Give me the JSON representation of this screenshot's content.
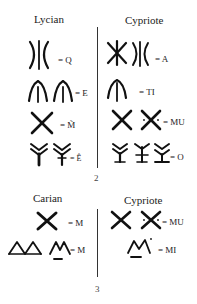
{
  "figure_2": {
    "number": "2",
    "left_heading": "Lycian",
    "right_heading": "Cypriote",
    "rows": [
      {
        "left_glyphs": [
          "lycian-q-sign"
        ],
        "left_value": "= Q",
        "right_glyphs": [
          "cypriote-a-asterisk-sign",
          "cypriote-a-bracket-sign"
        ],
        "right_value": "= A"
      },
      {
        "left_glyphs": [
          "lycian-e-sign-1",
          "lycian-e-sign-2"
        ],
        "left_value": "= E",
        "right_glyphs": [
          "cypriote-ti-sign"
        ],
        "right_value": "= TI"
      },
      {
        "left_glyphs": [
          "lycian-m-tilde-sign"
        ],
        "left_value": "= M̃",
        "right_glyphs": [
          "cypriote-mu-sign-1",
          "cypriote-mu-sign-2"
        ],
        "right_value": "= MU"
      },
      {
        "left_glyphs": [
          "lycian-e-hat-sign-1",
          "lycian-e-hat-sign-2"
        ],
        "left_value": "= Ê",
        "right_glyphs": [
          "cypriote-o-sign-1",
          "cypriote-o-sign-2",
          "cypriote-o-sign-3"
        ],
        "right_value": "= O"
      }
    ]
  },
  "figure_3": {
    "number": "3",
    "left_heading": "Carian",
    "right_heading": "Cypriote",
    "rows": [
      {
        "left_glyphs": [
          "carian-m-sign"
        ],
        "left_value": "= M",
        "right_glyphs": [
          "cypriote-mu-sign-1",
          "cypriote-mu-sign-2"
        ],
        "right_value": "= MU"
      },
      {
        "left_glyphs": [
          "carian-m-double-triangle-sign",
          "carian-m-underlined-sign"
        ],
        "left_value": "= M",
        "right_glyphs": [
          "cypriote-mi-sign"
        ],
        "right_value": "= MI"
      }
    ]
  }
}
